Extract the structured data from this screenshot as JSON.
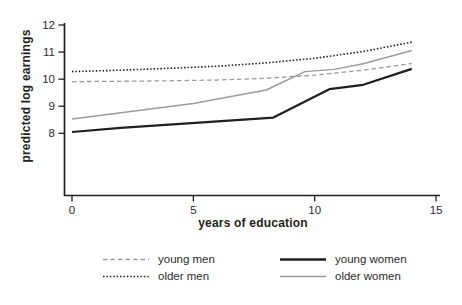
{
  "colors": {
    "black": "#1f1f1f",
    "gray": "#9b9b9b",
    "axis": "#231f20",
    "text": "#2b2b2b",
    "background": "#ffffff"
  },
  "chart_data": {
    "type": "line",
    "title": "",
    "xlabel": "years of education",
    "ylabel": "predicted log earnings",
    "xlim": [
      0,
      15.2
    ],
    "ylim": [
      5.7,
      12
    ],
    "x_ticks": [
      0,
      5,
      10,
      15
    ],
    "y_ticks": [
      8,
      9,
      10,
      11,
      12
    ],
    "grid": false,
    "legend_position": "bottom",
    "series": [
      {
        "name": "young_men",
        "label": "young men",
        "color": "gray",
        "style": "dashed",
        "width": 1.3,
        "points": [
          [
            0,
            9.91
          ],
          [
            2,
            9.92
          ],
          [
            4,
            9.94
          ],
          [
            6,
            9.97
          ],
          [
            8,
            10.03
          ],
          [
            10,
            10.15
          ],
          [
            12,
            10.33
          ],
          [
            14,
            10.58
          ]
        ]
      },
      {
        "name": "older_men",
        "label": "older men",
        "color": "black",
        "style": "dotted",
        "width": 1.6,
        "points": [
          [
            0,
            10.28
          ],
          [
            2,
            10.33
          ],
          [
            4,
            10.4
          ],
          [
            6,
            10.48
          ],
          [
            8,
            10.6
          ],
          [
            10,
            10.77
          ],
          [
            12,
            11.02
          ],
          [
            14,
            11.37
          ]
        ]
      },
      {
        "name": "young_women",
        "label": "young women",
        "color": "black",
        "style": "solid",
        "width": 2.2,
        "points": [
          [
            0,
            8.05
          ],
          [
            2,
            8.2
          ],
          [
            4,
            8.32
          ],
          [
            6,
            8.44
          ],
          [
            8,
            8.56
          ],
          [
            8.3,
            8.58
          ],
          [
            10.6,
            9.63
          ],
          [
            12,
            9.79
          ],
          [
            14,
            10.38
          ]
        ]
      },
      {
        "name": "older_women",
        "label": "older women",
        "color": "gray",
        "style": "solid",
        "width": 1.4,
        "points": [
          [
            0,
            8.53
          ],
          [
            5,
            9.1
          ],
          [
            8,
            9.6
          ],
          [
            9.6,
            10.28
          ],
          [
            10.8,
            10.36
          ],
          [
            12,
            10.57
          ],
          [
            14,
            11.06
          ]
        ]
      }
    ]
  }
}
